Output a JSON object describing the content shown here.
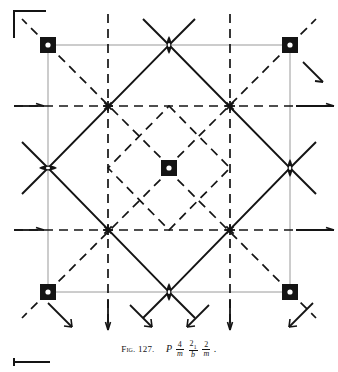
{
  "figure": {
    "label": "Fig. 127.",
    "space_group_symbol": "P 4/m 2_1/b 2/m",
    "lattice_letter": "P",
    "terms": [
      {
        "numerator": "4",
        "subscript": "",
        "denominator": "m"
      },
      {
        "numerator": "2",
        "subscript": "1",
        "denominator": "b"
      },
      {
        "numerator": "2",
        "subscript": "",
        "denominator": "m"
      }
    ],
    "terminal_punctuation": "."
  },
  "diagram": {
    "type": "space-group-symmetry-diagram",
    "colors": {
      "ink": "#141414",
      "cell_edge": "#8c8c8c",
      "background": "#ffffff",
      "symbol_fill": "#141414",
      "symbol_hole": "#ffffff"
    },
    "cell": {
      "left": 48,
      "top": 45,
      "right": 290,
      "bottom": 292,
      "edge_label": "unit-cell-outline"
    },
    "axes_bracket": {
      "top_left": {
        "name": "axes-corner-bracket",
        "x": 12,
        "y": 10,
        "w": 34,
        "h": 28
      },
      "bottom_left": {
        "name": "scale-corner-bracket",
        "x": 12,
        "y": 357,
        "w": 38,
        "h": 10
      }
    },
    "four_fold_inversion_axes": [
      {
        "name": "4-fold-axis-top-left",
        "x": 48,
        "y": 45
      },
      {
        "name": "4-fold-axis-top-right",
        "x": 290,
        "y": 45
      },
      {
        "name": "4-fold-axis-bottom-left",
        "x": 48,
        "y": 292
      },
      {
        "name": "4-fold-axis-bottom-right",
        "x": 290,
        "y": 292
      },
      {
        "name": "4-fold-axis-center",
        "x": 169,
        "y": 168
      }
    ],
    "two_fold_axes": [
      {
        "name": "2-fold-axis-top-center",
        "x": 169,
        "y": 45,
        "orientation": "vertical"
      },
      {
        "name": "2-fold-axis-bottom-center",
        "x": 169,
        "y": 292,
        "orientation": "vertical"
      },
      {
        "name": "2-fold-axis-left-center",
        "x": 48,
        "y": 168,
        "orientation": "vertical"
      },
      {
        "name": "2-fold-axis-right-center",
        "x": 290,
        "y": 168,
        "orientation": "vertical"
      }
    ],
    "screw_axis_nodes": [
      {
        "name": "2_1-screw-node-upper-left",
        "x": 108,
        "y": 106
      },
      {
        "name": "2_1-screw-node-upper-right",
        "x": 230,
        "y": 106
      },
      {
        "name": "2_1-screw-node-lower-left",
        "x": 108,
        "y": 230
      },
      {
        "name": "2_1-screw-node-lower-right",
        "x": 230,
        "y": 230
      }
    ],
    "mirror_lines_dashed": {
      "name": "mirror-and-glide-planes",
      "horizontal_y": [
        106,
        230
      ],
      "vertical_x": [
        108,
        230
      ]
    },
    "diamond_outline": {
      "name": "diagonal-mirror-diamond",
      "vertices": [
        [
          169,
          45
        ],
        [
          290,
          168
        ],
        [
          169,
          292
        ],
        [
          48,
          168
        ]
      ]
    },
    "inner_diamond_dashed": {
      "name": "inner-diagonal-glide-diamond",
      "vertices": [
        [
          169,
          106
        ],
        [
          230,
          168
        ],
        [
          169,
          230
        ],
        [
          108,
          168
        ]
      ]
    },
    "corner_diagonals_dashed": {
      "name": "corner-diagonal-glide-lines"
    },
    "glide_arrows": [
      {
        "name": "glide-arrow-up-right-outer-topright",
        "direction": "down-right"
      },
      {
        "name": "glide-arrow-outer-right-upper",
        "direction": "right"
      },
      {
        "name": "glide-arrow-outer-right-lower",
        "direction": "right"
      },
      {
        "name": "glide-arrow-outer-left-upper",
        "direction": "right"
      },
      {
        "name": "glide-arrow-outer-left-lower",
        "direction": "right"
      },
      {
        "name": "glide-arrow-bottom-left-diagonal",
        "direction": "down-right"
      },
      {
        "name": "glide-arrow-bottom-right-diagonal",
        "direction": "down-left"
      },
      {
        "name": "glide-arrow-bottom-inner-left",
        "direction": "down-right"
      },
      {
        "name": "glide-arrow-bottom-inner-right",
        "direction": "down-left"
      },
      {
        "name": "glide-arrow-bottom-vertical-left",
        "direction": "down"
      },
      {
        "name": "glide-arrow-bottom-vertical-right",
        "direction": "down"
      },
      {
        "name": "glide-arrow-topright-diagonal",
        "direction": "down-right"
      }
    ]
  }
}
